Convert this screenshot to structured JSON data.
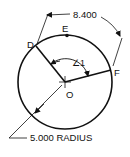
{
  "diagram": {
    "type": "circle-arc-geometry",
    "points": {
      "D": "D",
      "E": "E",
      "F": "F",
      "O": "O"
    },
    "angle_label": "∠1",
    "arc_length_label": "8.400",
    "radius_label": "5.000 RADIUS",
    "colors": {
      "stroke": "#111111",
      "background": "#ffffff"
    }
  }
}
